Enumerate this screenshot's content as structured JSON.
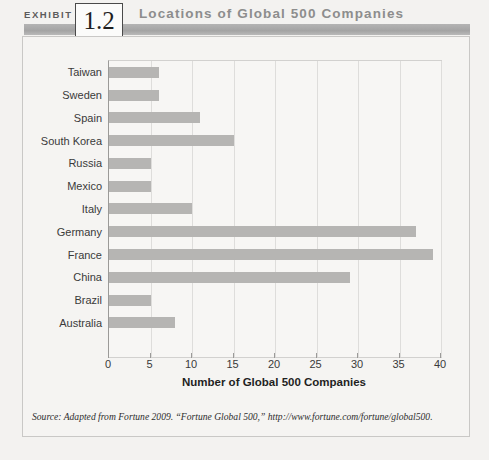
{
  "header": {
    "exhibit_label": "EXHIBIT",
    "number": "1.2",
    "title": "Locations of Global 500 Companies"
  },
  "source_note": "Source: Adapted from Fortune 2009. “Fortune Global 500,” http://www.fortune.com/fortune/global500.",
  "colors": {
    "bar": "#b6b5b3",
    "header_bar": "#a9a9a9",
    "title_text": "#8d8d8d",
    "plot_bg": "#f7f6f4",
    "grid": "#dedddb"
  },
  "chart_data": {
    "type": "bar",
    "orientation": "horizontal",
    "title": "Locations of Global 500 Companies",
    "xlabel": "Number of Global 500 Companies",
    "ylabel": "",
    "xlim": [
      0,
      40
    ],
    "xticks": [
      0,
      5,
      10,
      15,
      20,
      25,
      30,
      35,
      40
    ],
    "grid": true,
    "legend": false,
    "categories": [
      "Taiwan",
      "Sweden",
      "Spain",
      "South Korea",
      "Russia",
      "Mexico",
      "Italy",
      "Germany",
      "France",
      "China",
      "Brazil",
      "Australia"
    ],
    "values": [
      6,
      6,
      11,
      15,
      5,
      5,
      10,
      37,
      39,
      29,
      5,
      8
    ]
  }
}
